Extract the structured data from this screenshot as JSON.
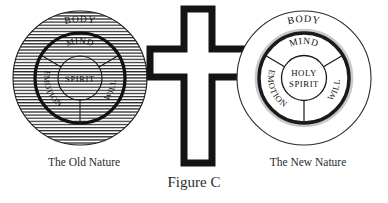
{
  "figure": {
    "caption": "Figure C",
    "background_color": "#ffffff",
    "ink_color": "#1a1a1a"
  },
  "center_symbol": {
    "icon": "cross-icon",
    "fill_color": "#ffffff",
    "stroke_color": "#1a1a1a"
  },
  "diagrams": [
    {
      "id": "old-nature",
      "label": "The Old Nature",
      "shading": "horizontal-hatch",
      "rings": [
        {
          "name": "outer",
          "label": "BODY"
        },
        {
          "name": "middle",
          "label": "MIND"
        },
        {
          "name": "middle-left",
          "label": "EMOTION"
        },
        {
          "name": "middle-right",
          "label": "WILL"
        },
        {
          "name": "core",
          "label": "SPIRIT"
        }
      ]
    },
    {
      "id": "new-nature",
      "label": "The New Nature",
      "shading": "none",
      "rings": [
        {
          "name": "outer",
          "label": "BODY"
        },
        {
          "name": "middle",
          "label": "MIND"
        },
        {
          "name": "middle-left",
          "label": "EMOTION"
        },
        {
          "name": "middle-right",
          "label": "WILL"
        },
        {
          "name": "core",
          "label": "HOLY SPIRIT"
        },
        {
          "name": "core-line-1",
          "label": "HOLY"
        },
        {
          "name": "core-line-2",
          "label": "SPIRIT"
        }
      ]
    }
  ]
}
